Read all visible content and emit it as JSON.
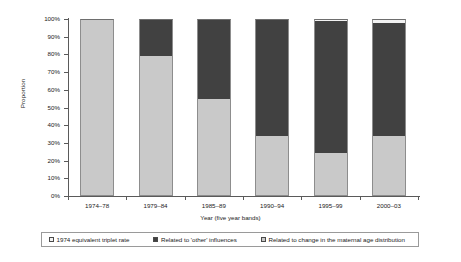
{
  "chart_data": {
    "type": "bar",
    "subtype": "stacked-100-percent",
    "title": "",
    "xlabel": "Year (five year bands)",
    "ylabel": "Proportion",
    "categories": [
      "1974–78",
      "1979–84",
      "1985–89",
      "1990–94",
      "1995–99",
      "2000–03"
    ],
    "ylim": [
      0,
      100
    ],
    "ytick_labels": [
      "0%",
      "10%",
      "20%",
      "30%",
      "40%",
      "50%",
      "60%",
      "70%",
      "80%",
      "90%",
      "100%"
    ],
    "ytick_values": [
      0,
      10,
      20,
      30,
      40,
      50,
      60,
      70,
      80,
      90,
      100
    ],
    "grid": false,
    "legend_position": "bottom",
    "series": [
      {
        "name": "Related to change in the maternal age distribution",
        "color": "#c9c9c9",
        "values": [
          100,
          79,
          55,
          34,
          24.5,
          34
        ]
      },
      {
        "name": "Related to 'other' influences",
        "color": "#414141",
        "values": [
          0,
          21,
          45,
          66,
          74.5,
          64
        ]
      },
      {
        "name": "1974 equivalent triplet rate",
        "color": "#f2f2f2",
        "values": [
          0,
          0,
          0,
          0,
          1,
          2
        ]
      }
    ],
    "legend": [
      {
        "label": "1974 equivalent triplet rate",
        "color": "#f2f2f2"
      },
      {
        "label": "Related to 'other' influences",
        "color": "#414141"
      },
      {
        "label": "Related to change in the maternal age distribution",
        "color": "#c9c9c9"
      }
    ]
  }
}
